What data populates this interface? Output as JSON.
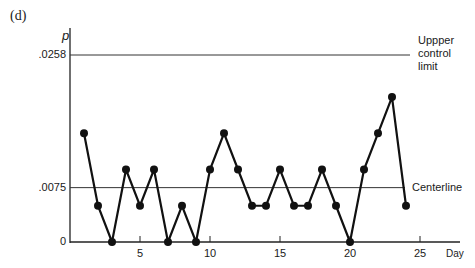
{
  "panel_label": "(d)",
  "chart_data": {
    "type": "line",
    "title": "",
    "xlabel": "Day",
    "ylabel": "p",
    "x": [
      1,
      2,
      3,
      4,
      5,
      6,
      7,
      8,
      9,
      10,
      11,
      12,
      13,
      14,
      15,
      16,
      17,
      18,
      19,
      20,
      21,
      22,
      23,
      24
    ],
    "values": [
      0.015,
      0.005,
      0,
      0.01,
      0.005,
      0.01,
      0,
      0.005,
      0,
      0.01,
      0.015,
      0.01,
      0.005,
      0.005,
      0.01,
      0.005,
      0.005,
      0.01,
      0.005,
      0,
      0.01,
      0.015,
      0.02,
      0.005
    ],
    "x_ticks": [
      5,
      10,
      15,
      20,
      25
    ],
    "y_ticks": [
      "0",
      ".0075",
      ".0258"
    ],
    "ylim": [
      0,
      0.0258
    ],
    "xlim": [
      0,
      26
    ],
    "reference_lines": [
      {
        "name": "Uppper control limit",
        "value": 0.0258
      },
      {
        "name": "Centerline",
        "value": 0.0075
      }
    ],
    "grid": false,
    "legend": "none"
  },
  "annotations": {
    "ucl_lines": [
      "Uppper",
      "control",
      "limit"
    ],
    "centerline": "Centerline"
  }
}
